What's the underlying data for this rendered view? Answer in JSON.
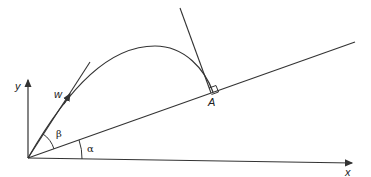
{
  "diagram": {
    "labels": {
      "y_axis": "y",
      "x_axis": "x",
      "velocity": "w",
      "landing_point": "A",
      "launch_angle": "β",
      "incline_angle": "α"
    },
    "colors": {
      "stroke": "#333333",
      "background": "#ffffff"
    }
  }
}
